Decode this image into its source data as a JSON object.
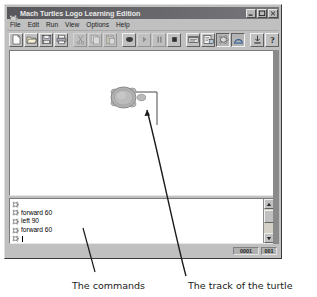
{
  "window": {
    "title": "Mach Turtles Logo Learning Edition",
    "icon": "turtle-icon",
    "controls": [
      {
        "name": "minimize-button",
        "glyph": "minimize"
      },
      {
        "name": "maximize-button",
        "glyph": "maximize"
      },
      {
        "name": "close-button",
        "glyph": "close"
      }
    ]
  },
  "menu": {
    "items": [
      {
        "label": "File"
      },
      {
        "label": "Edit"
      },
      {
        "label": "Run"
      },
      {
        "label": "View"
      },
      {
        "label": "Options"
      },
      {
        "label": "Help"
      }
    ]
  },
  "toolbar": {
    "buttons": [
      {
        "name": "new-button",
        "icon": "new-document-icon",
        "state": "enabled"
      },
      {
        "name": "open-button",
        "icon": "open-folder-icon",
        "state": "enabled"
      },
      {
        "name": "save-button",
        "icon": "save-disk-icon",
        "state": "enabled"
      },
      {
        "name": "print-button",
        "icon": "printer-icon",
        "state": "enabled"
      },
      {
        "name": "cut-button",
        "icon": "scissors-icon",
        "state": "disabled"
      },
      {
        "name": "copy-button",
        "icon": "copy-icon",
        "state": "disabled"
      },
      {
        "name": "paste-button",
        "icon": "clipboard-icon",
        "state": "disabled"
      },
      {
        "name": "run-button",
        "icon": "play-icon",
        "state": "enabled"
      },
      {
        "name": "step-button",
        "icon": "step-icon",
        "state": "disabled"
      },
      {
        "name": "pause-button",
        "icon": "pause-icon",
        "state": "disabled"
      },
      {
        "name": "stop-button",
        "icon": "stop-icon",
        "state": "enabled"
      },
      {
        "name": "editor-button",
        "icon": "editor-window-icon",
        "state": "enabled"
      },
      {
        "name": "procedures-button",
        "icon": "procedures-icon",
        "state": "enabled"
      },
      {
        "name": "turtle-button",
        "icon": "turtle-icon",
        "state": "pressed"
      },
      {
        "name": "pen-button",
        "icon": "pen-icon",
        "state": "pressed"
      },
      {
        "name": "download-button",
        "icon": "download-icon",
        "state": "enabled"
      },
      {
        "name": "help-button",
        "icon": "question-mark-icon",
        "state": "enabled"
      }
    ]
  },
  "canvas": {
    "turtle": {
      "name": "turtle-sprite",
      "x": 118,
      "y": 85,
      "heading": "right"
    },
    "track": {
      "name": "turtle-track-path",
      "color": "#4a4a4a"
    }
  },
  "console": {
    "lines": [
      {
        "prompt": "turtle-prompt-icon",
        "text": "",
        "active": false
      },
      {
        "prompt": "turtle-prompt-icon",
        "text": "forward 60",
        "active": false
      },
      {
        "prompt": "turtle-prompt-icon",
        "text": "left 90",
        "active": false
      },
      {
        "prompt": "turtle-prompt-icon",
        "text": "forward 60",
        "active": false
      },
      {
        "prompt": "turtle-prompt-icon",
        "text": "",
        "active": true
      }
    ],
    "scrollbar": {
      "up_arrow": "scroll-up-arrow-icon",
      "down_arrow": "scroll-down-arrow-icon",
      "thumb": "scroll-thumb"
    }
  },
  "status_bar": {
    "cells": [
      {
        "name": "status-coordinates",
        "value": "0001"
      },
      {
        "name": "status-indicator",
        "value": "001"
      }
    ]
  },
  "annotations": [
    {
      "name": "annotation-commands",
      "text": "The commands"
    },
    {
      "name": "annotation-track",
      "text": "The track of the turtle"
    }
  ]
}
